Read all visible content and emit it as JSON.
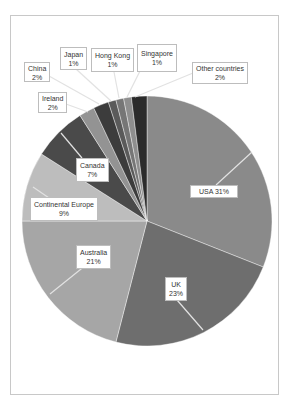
{
  "chart_data": {
    "type": "pie",
    "title": "",
    "start_angle_deg": 0,
    "direction": "clockwise",
    "center": [
      147,
      221
    ],
    "radius": 125,
    "slices": [
      {
        "name": "USA",
        "value": 31,
        "label": "USA 31%",
        "color": "#8a8a8a"
      },
      {
        "name": "UK",
        "value": 23,
        "label": "UK\n23%",
        "color": "#6e6e6e"
      },
      {
        "name": "Australia",
        "value": 21,
        "label": "Australia\n21%",
        "color": "#a6a6a6"
      },
      {
        "name": "Continental Europe",
        "value": 9,
        "label": "Continental Europe\n9%",
        "color": "#bdbdbd"
      },
      {
        "name": "Canada",
        "value": 7,
        "label": "Canada\n7%",
        "color": "#4a4a4a"
      },
      {
        "name": "Ireland",
        "value": 2,
        "label": "Ireland\n2%",
        "color": "#939393"
      },
      {
        "name": "China",
        "value": 2,
        "label": "China\n2%",
        "color": "#3c3c3c"
      },
      {
        "name": "Japan",
        "value": 1,
        "label": "Japan\n1%",
        "color": "#5a5a5a"
      },
      {
        "name": "Hong Kong",
        "value": 1,
        "label": "Hong Kong\n1%",
        "color": "#767676"
      },
      {
        "name": "Singapore",
        "value": 1,
        "label": "Singapore\n1%",
        "color": "#8e8e8e"
      },
      {
        "name": "Other countries",
        "value": 2,
        "label": "Other countries\n2%",
        "color": "#2b2b2b"
      }
    ]
  },
  "labels": [
    {
      "name": "USA",
      "line1": "USA 31%",
      "line2": "",
      "box": [
        190,
        185,
        48,
        13
      ],
      "anchor": [
        252,
        152
      ],
      "tip": [
        216,
        185
      ]
    },
    {
      "name": "UK",
      "line1": "UK",
      "line2": "23%",
      "box": [
        165,
        277,
        18,
        24
      ],
      "anchor": [
        203,
        330
      ],
      "tip": [
        177,
        300
      ]
    },
    {
      "name": "Australia",
      "line1": "Australia",
      "line2": "21%",
      "box": [
        76,
        245,
        34,
        24
      ],
      "anchor": [
        50,
        294
      ],
      "tip": [
        86,
        265
      ]
    },
    {
      "name": "Continental Europe",
      "line1": "Continental Europe",
      "line2": "9%",
      "box": [
        30,
        197,
        65,
        24
      ],
      "anchor": [
        33,
        187
      ],
      "tip": [
        52,
        200
      ]
    },
    {
      "name": "Canada",
      "line1": "Canada",
      "line2": "7%",
      "box": [
        76,
        158,
        28,
        24
      ],
      "anchor": [
        61,
        133
      ],
      "tip": [
        82,
        158
      ]
    },
    {
      "name": "Ireland",
      "line1": "Ireland",
      "line2": "2%",
      "box": [
        38,
        92,
        29,
        21
      ],
      "anchor": [
        88,
        112
      ],
      "tip": [
        66,
        104
      ]
    },
    {
      "name": "China",
      "line1": "China",
      "line2": "2%",
      "box": [
        24,
        62,
        26,
        20
      ],
      "anchor": [
        99,
        104
      ],
      "tip": [
        49,
        76
      ]
    },
    {
      "name": "Japan",
      "line1": "Japan",
      "line2": "1%",
      "box": [
        60,
        47,
        19,
        23
      ],
      "anchor": [
        111,
        101
      ],
      "tip": [
        76,
        69
      ]
    },
    {
      "name": "Hong Kong",
      "line1": "Hong Kong",
      "line2": "1%",
      "box": [
        91,
        48,
        38,
        24
      ],
      "anchor": [
        119,
        98
      ],
      "tip": [
        114,
        72
      ]
    },
    {
      "name": "Singapore",
      "line1": "Singapore",
      "line2": "1%",
      "box": [
        137,
        44,
        36,
        28
      ],
      "anchor": [
        127,
        97
      ],
      "tip": [
        140,
        71
      ]
    },
    {
      "name": "Other countries",
      "line1": "Other countries",
      "line2": "2%",
      "box": [
        192,
        62,
        56,
        22
      ],
      "anchor": [
        135,
        97
      ],
      "tip": [
        193,
        73
      ]
    }
  ]
}
